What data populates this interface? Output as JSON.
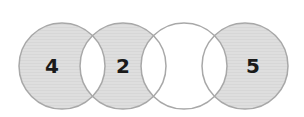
{
  "diagram": {
    "type": "overlapping-circles-chain",
    "colors": {
      "filled": "#dcdcdc",
      "empty": "#ffffff",
      "stroke": "#a8a8a8",
      "text": "#1a1a1a"
    },
    "circles": [
      {
        "label": "4",
        "filled": true
      },
      {
        "label": "2",
        "filled": true
      },
      {
        "label": "",
        "filled": false
      },
      {
        "label": "5",
        "filled": true
      }
    ]
  }
}
